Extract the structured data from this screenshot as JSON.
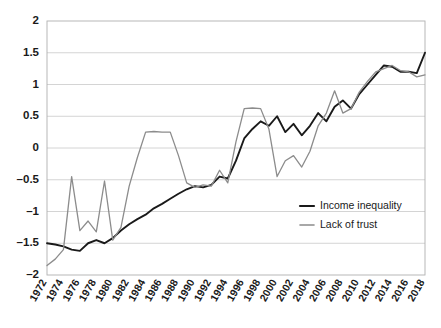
{
  "chart_data": {
    "type": "line",
    "title": "",
    "subtitle": "",
    "xlabel": "",
    "ylabel": "",
    "xlim": [
      1972,
      2018
    ],
    "ylim": [
      -2,
      2
    ],
    "ytick_values": [
      2,
      1.5,
      1,
      0.5,
      0,
      -0.5,
      -1,
      -1.5,
      -2
    ],
    "ytick_labels": [
      "2",
      "1.5",
      "1",
      "0.5",
      "0",
      "-0.5",
      "-1",
      "-1.5",
      "-2"
    ],
    "xtick_values": [
      1972,
      1974,
      1976,
      1978,
      1980,
      1982,
      1984,
      1986,
      1988,
      1990,
      1992,
      1994,
      1996,
      1998,
      2000,
      2002,
      2004,
      2006,
      2008,
      2010,
      2012,
      2014,
      2016,
      2018
    ],
    "xtick_labels": [
      "1972",
      "1974",
      "1976",
      "1978",
      "1980",
      "1982",
      "1984",
      "1986",
      "1988",
      "1990",
      "1992",
      "1994",
      "1996",
      "1998",
      "2000",
      "2002",
      "2004",
      "2006",
      "2008",
      "2010",
      "2012",
      "2014",
      "2016",
      "2018"
    ],
    "xtick_rotation": -60,
    "grid": true,
    "grid_axis": "y",
    "grid_color": "#c9c9c9",
    "plot_border_color": "#b0b0b0",
    "background": "#ffffff",
    "legend": {
      "position": "inside-lower-right",
      "entries": [
        {
          "name": "Income inequality",
          "color": "#1a1a1a"
        },
        {
          "name": "Lack of trust",
          "color": "#8c8c8c"
        }
      ]
    },
    "x": [
      1972,
      1973,
      1974,
      1975,
      1976,
      1977,
      1978,
      1979,
      1980,
      1981,
      1982,
      1983,
      1984,
      1985,
      1986,
      1987,
      1988,
      1989,
      1990,
      1991,
      1992,
      1993,
      1994,
      1995,
      1996,
      1997,
      1998,
      1999,
      2000,
      2001,
      2002,
      2003,
      2004,
      2005,
      2006,
      2007,
      2008,
      2009,
      2010,
      2011,
      2012,
      2013,
      2014,
      2015,
      2016,
      2017,
      2018
    ],
    "series": [
      {
        "name": "Income inequality",
        "color": "#1a1a1a",
        "line_width": 1.9,
        "values": [
          -1.5,
          -1.52,
          -1.55,
          -1.6,
          -1.62,
          -1.5,
          -1.45,
          -1.5,
          -1.42,
          -1.3,
          -1.2,
          -1.12,
          -1.05,
          -0.95,
          -0.88,
          -0.8,
          -0.72,
          -0.65,
          -0.6,
          -0.62,
          -0.58,
          -0.45,
          -0.48,
          -0.2,
          0.15,
          0.3,
          0.42,
          0.35,
          0.5,
          0.25,
          0.38,
          0.2,
          0.35,
          0.55,
          0.42,
          0.65,
          0.75,
          0.62,
          0.85,
          1.0,
          1.15,
          1.3,
          1.28,
          1.2,
          1.2,
          1.18,
          1.5
        ]
      },
      {
        "name": "Lack of trust",
        "color": "#8c8c8c",
        "line_width": 1.3,
        "values": [
          -1.85,
          -1.75,
          -1.6,
          -0.45,
          -1.3,
          -1.15,
          -1.32,
          -0.52,
          -1.45,
          -1.25,
          -0.6,
          -0.15,
          0.25,
          0.26,
          0.25,
          0.25,
          -0.12,
          -0.55,
          -0.62,
          -0.58,
          -0.6,
          -0.35,
          -0.55,
          0.1,
          0.62,
          0.63,
          0.62,
          0.3,
          -0.45,
          -0.2,
          -0.12,
          -0.3,
          -0.05,
          0.35,
          0.55,
          0.9,
          0.55,
          0.62,
          0.88,
          1.05,
          1.2,
          1.25,
          1.3,
          1.22,
          1.2,
          1.12,
          1.15
        ]
      }
    ]
  },
  "legend_items": [
    {
      "label": "Income inequality"
    },
    {
      "label": "Lack of trust"
    }
  ]
}
